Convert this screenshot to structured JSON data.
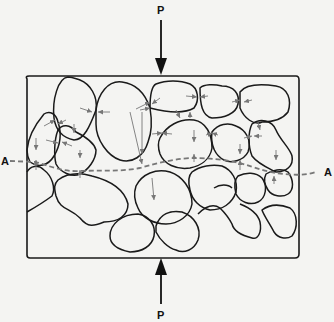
{
  "figure": {
    "type": "granular-soil-stress-diagram",
    "labels": {
      "load_top": "P",
      "load_bottom": "P",
      "section_left": "A",
      "section_right": "A"
    },
    "colors": {
      "background": "#f4f4f2",
      "outline": "#1a1a1a",
      "contact_arrows": "#777777",
      "section_line": "#777777"
    }
  }
}
